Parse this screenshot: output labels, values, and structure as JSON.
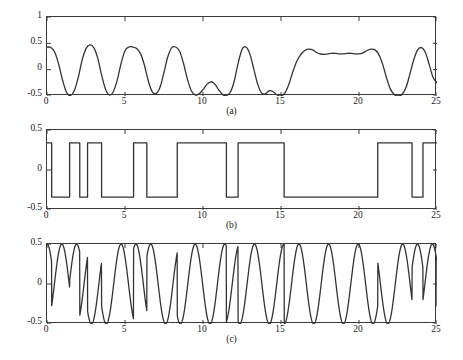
{
  "figure": {
    "background_color": "#ffffff",
    "line_color": "#333333",
    "axis_color": "#3a3a3a",
    "width": 463,
    "height": 360
  },
  "chart_data": [
    {
      "type": "line",
      "id": "panel-a",
      "title": "",
      "caption": "(a)",
      "xlabel": "",
      "ylabel": "",
      "xlim": [
        0,
        25
      ],
      "ylim": [
        -0.5,
        1
      ],
      "xticks": [
        0,
        5,
        10,
        15,
        20,
        25
      ],
      "xtick_labels": [
        "0",
        "5",
        "10",
        "15",
        "20",
        "25"
      ],
      "yticks": [
        -0.5,
        0,
        0.5,
        1
      ],
      "ytick_labels": [
        "-0.5",
        "0",
        "0.5",
        "1"
      ],
      "grid": false,
      "legend": null,
      "description": "Smoothed / filtered baseband waveform oscillating between about -0.5 and 0.5 with a flat plateau near 0.3 between t=17 and t=21",
      "x": [
        0.0,
        0.25,
        0.5,
        0.75,
        1.0,
        1.25,
        1.5,
        1.75,
        2.0,
        2.25,
        2.5,
        2.75,
        3.0,
        3.25,
        3.5,
        3.75,
        4.0,
        4.25,
        4.5,
        4.75,
        5.0,
        5.25,
        5.5,
        5.75,
        6.0,
        6.25,
        6.5,
        6.75,
        7.0,
        7.25,
        7.5,
        7.75,
        8.0,
        8.25,
        8.5,
        8.75,
        9.0,
        9.25,
        9.5,
        9.75,
        10.0,
        10.25,
        10.5,
        10.75,
        11.0,
        11.25,
        11.5,
        11.75,
        12.0,
        12.25,
        12.5,
        12.75,
        13.0,
        13.25,
        13.5,
        13.75,
        14.0,
        14.25,
        14.5,
        14.75,
        15.0,
        15.25,
        15.5,
        15.75,
        16.0,
        16.25,
        16.5,
        16.75,
        17.0,
        17.25,
        17.5,
        17.75,
        18.0,
        18.25,
        18.5,
        18.75,
        19.0,
        19.25,
        19.5,
        19.75,
        20.0,
        20.25,
        20.5,
        20.75,
        21.0,
        21.25,
        21.5,
        21.75,
        22.0,
        22.25,
        22.5,
        22.75,
        23.0,
        23.25,
        23.5,
        23.75,
        24.0,
        24.25,
        24.5,
        24.75,
        25.0
      ],
      "y": [
        0.43,
        0.42,
        0.33,
        0.1,
        -0.2,
        -0.43,
        -0.49,
        -0.4,
        -0.15,
        0.18,
        0.4,
        0.47,
        0.42,
        0.22,
        -0.1,
        -0.37,
        -0.48,
        -0.42,
        -0.2,
        0.12,
        0.36,
        0.43,
        0.43,
        0.4,
        0.3,
        0.08,
        -0.22,
        -0.42,
        -0.45,
        -0.33,
        -0.05,
        0.25,
        0.42,
        0.43,
        0.35,
        0.12,
        -0.18,
        -0.4,
        -0.48,
        -0.46,
        -0.38,
        -0.28,
        -0.23,
        -0.27,
        -0.38,
        -0.47,
        -0.49,
        -0.43,
        -0.22,
        0.12,
        0.38,
        0.43,
        0.3,
        0.02,
        -0.27,
        -0.44,
        -0.46,
        -0.4,
        -0.42,
        -0.48,
        -0.5,
        -0.44,
        -0.28,
        -0.05,
        0.15,
        0.28,
        0.36,
        0.39,
        0.38,
        0.33,
        0.3,
        0.29,
        0.3,
        0.31,
        0.31,
        0.3,
        0.3,
        0.31,
        0.31,
        0.3,
        0.3,
        0.32,
        0.36,
        0.39,
        0.38,
        0.3,
        0.12,
        -0.14,
        -0.36,
        -0.47,
        -0.5,
        -0.47,
        -0.35,
        -0.1,
        0.18,
        0.37,
        0.42,
        0.33,
        0.1,
        -0.15,
        -0.25
      ]
    },
    {
      "type": "line",
      "id": "panel-b",
      "title": "",
      "caption": "(b)",
      "xlabel": "",
      "ylabel": "",
      "xlim": [
        0,
        25
      ],
      "ylim": [
        -0.5,
        0.5
      ],
      "xticks": [
        0,
        5,
        10,
        15,
        20,
        25
      ],
      "xtick_labels": [
        "0",
        "5",
        "10",
        "15",
        "20",
        "25"
      ],
      "yticks": [
        -0.5,
        0,
        0.5
      ],
      "ytick_labels": [
        "-0.5",
        "0",
        "0.5"
      ],
      "grid": false,
      "legend": null,
      "description": "Bipolar binary NRZ data sequence switching between +0.34 and -0.34",
      "high_level": 0.34,
      "low_level": -0.34,
      "transitions": [
        0.0,
        0.3,
        1.45,
        2.1,
        2.6,
        3.5,
        5.55,
        6.4,
        8.35,
        11.5,
        12.25,
        15.2,
        21.2,
        23.4,
        24.1,
        25.0
      ],
      "levels": [
        0.34,
        -0.34,
        0.34,
        -0.34,
        0.34,
        -0.34,
        0.34,
        -0.34,
        0.34,
        -0.34,
        0.34,
        -0.34,
        0.34,
        -0.34,
        0.34,
        -0.34
      ]
    },
    {
      "type": "line",
      "id": "panel-c",
      "title": "",
      "caption": "(c)",
      "xlabel": "",
      "ylabel": "",
      "xlim": [
        0,
        25
      ],
      "ylim": [
        -0.5,
        0.5
      ],
      "xticks": [
        0,
        5,
        10,
        15,
        20,
        25
      ],
      "xtick_labels": [
        "0",
        "5",
        "10",
        "15",
        "20",
        "25"
      ],
      "yticks": [
        -0.5,
        0,
        0.5
      ],
      "ytick_labels": [
        "-0.5",
        "0",
        "0.5"
      ],
      "grid": false,
      "legend": null,
      "description": "Phase-modulated carrier of amplitude 0.5; envelope constant, phase reverses at the data transitions of panel (b)",
      "amplitude": 0.5,
      "carrier_period": 1.9,
      "phase_flip_times": [
        0.0,
        0.3,
        1.45,
        2.1,
        2.6,
        3.5,
        5.55,
        6.4,
        8.35,
        11.5,
        12.25,
        15.2,
        21.2,
        23.4,
        24.1
      ]
    }
  ],
  "panels": {
    "a": {
      "caption": "(a)",
      "ytick_labels": [
        "1",
        "0.5",
        "0",
        "-0.5"
      ],
      "xtick_labels": [
        "0",
        "5",
        "10",
        "15",
        "20",
        "25"
      ]
    },
    "b": {
      "caption": "(b)",
      "ytick_labels": [
        "0.5",
        "0",
        "-0.5"
      ],
      "xtick_labels": [
        "0",
        "5",
        "10",
        "15",
        "20",
        "25"
      ]
    },
    "c": {
      "caption": "(c)",
      "ytick_labels": [
        "0.5",
        "0",
        "-0.5"
      ],
      "xtick_labels": [
        "0",
        "5",
        "10",
        "15",
        "20",
        "25"
      ]
    }
  }
}
